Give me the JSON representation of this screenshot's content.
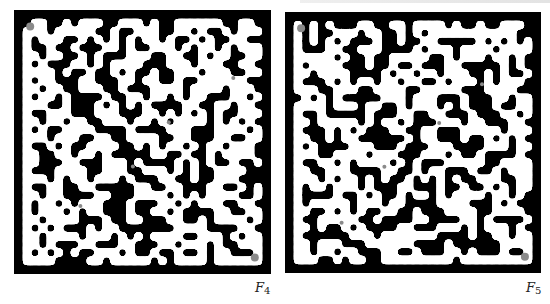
{
  "figure": {
    "panels": [
      {
        "id": "F4",
        "label_main": "F",
        "label_sub": "4",
        "wall_color": "#000000",
        "path_color": "#ffffff",
        "marker_color": "#8a8a8a",
        "grid": [
          "100110100011000101100000011001",
          "000100000110110001100101101000",
          "010001101010101001011010110011",
          "011011011100101100010100101000",
          "001001101011100011001101001100",
          "010111001010000111000100011001",
          "000010110110101101100010001100",
          "010011100111001001101100000011",
          "001001100011011100001000010001",
          "010010111101100100101001110010",
          "000110111010101011110011001001",
          "011000111000111001010101011000",
          "001001001100010010100001010101",
          "010110000111101111000111000010",
          "000100011001100001100111001100",
          "011010110000110101001010010001",
          "001100100101111100110110100001",
          "001110011100010111101010110110",
          "011100001100011000101011000011",
          "000101001000101110011011000111",
          "011001100111110011001110011010",
          "001001111001110000101010000110",
          "010010100011101110010100011001",
          "010001010011101100101111001100",
          "001000011101100111001101000010",
          "010101110100111111100001111001",
          "001000010001010100001100010100",
          "001011100111001110010001011000",
          "010101011000101101101101001110",
          "000011110010000010100001000000"
        ],
        "markers": [
          {
            "x": 0.03,
            "y": 0.03,
            "size": "large"
          },
          {
            "x": 0.88,
            "y": 0.24,
            "size": "small"
          },
          {
            "x": 0.61,
            "y": 0.42,
            "size": "small"
          },
          {
            "x": 0.46,
            "y": 0.6,
            "size": "small"
          },
          {
            "x": 0.24,
            "y": 0.76,
            "size": "small"
          },
          {
            "x": 0.97,
            "y": 0.97,
            "size": "large"
          }
        ]
      },
      {
        "id": "F5",
        "label_main": "F",
        "label_sub": "5",
        "wall_color": "#000000",
        "path_color": "#ffffff",
        "marker_color": "#8a8a8a",
        "grid": [
          "010101110011001000010110110001",
          "010110001001101010000000000011",
          "010101011101101100111110101010",
          "011100110001111010001000010000",
          "000001011011000001101000100101",
          "010000111011011011100111110101",
          "001000011110100100100011010110",
          "011101010010010011010001010001",
          "000110001100001100000111000011",
          "101010111110001000111011100100",
          "000010001001101000101011101100",
          "011011111011100110011101110010",
          "001000001010010111000100111001",
          "011101010111001100111000001000",
          "001101001111110100111011010101",
          "010111100011101110001111000100",
          "000110000100011100010110111101",
          "011001010000101011100000110000",
          "001100011110011010011101101000",
          "000101001010110101010110001100",
          "010010001011100111011011010100",
          "011110110101101001010000100101",
          "010000010001001111000011101011",
          "001101010110011011100001100001",
          "011000001101111001111001011110",
          "001011010111100111000101000101",
          "011111100010000000111101100100",
          "001000111000000111101111110000",
          "001001001110011011100101110110",
          "000110100110000000001000000000"
        ],
        "markers": [
          {
            "x": 0.03,
            "y": 0.03,
            "size": "large"
          },
          {
            "x": 0.79,
            "y": 0.26,
            "size": "small"
          },
          {
            "x": 0.61,
            "y": 0.42,
            "size": "small"
          },
          {
            "x": 0.38,
            "y": 0.6,
            "size": "small"
          },
          {
            "x": 0.2,
            "y": 0.83,
            "size": "small"
          },
          {
            "x": 0.97,
            "y": 0.97,
            "size": "large"
          }
        ]
      }
    ]
  }
}
